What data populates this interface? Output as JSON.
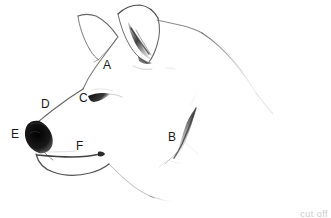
{
  "figure": {
    "background_color": "#ffffff",
    "ink_color": "#2b2b2b",
    "width": 331,
    "height": 218
  },
  "labels": [
    {
      "key": "A",
      "text": "A",
      "x": 103,
      "y": 59,
      "refers_to": "forehead-stop"
    },
    {
      "key": "B",
      "text": "B",
      "x": 168,
      "y": 131,
      "refers_to": "cheek-ruff"
    },
    {
      "key": "C",
      "text": "C",
      "x": 79,
      "y": 92,
      "refers_to": "eye"
    },
    {
      "key": "D",
      "text": "D",
      "x": 41,
      "y": 98,
      "refers_to": "muzzle-bridge"
    },
    {
      "key": "E",
      "text": "E",
      "x": 11,
      "y": 128,
      "refers_to": "nose"
    },
    {
      "key": "F",
      "text": "F",
      "x": 76,
      "y": 140,
      "refers_to": "mouth-lip-line"
    }
  ],
  "caption": {
    "mark": "cut off"
  }
}
